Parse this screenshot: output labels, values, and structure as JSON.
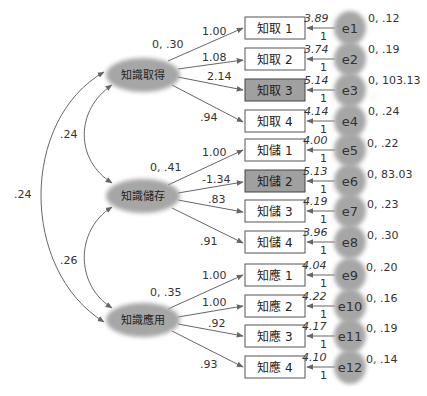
{
  "diagram": {
    "type": "SEM path diagram (confirmatory factor analysis)",
    "factors": [
      {
        "id": "f1",
        "label": "知識取得",
        "mean_var": "0, .30"
      },
      {
        "id": "f2",
        "label": "知識儲存",
        "mean_var": "0, .41"
      },
      {
        "id": "f3",
        "label": "知識應用",
        "mean_var": "0, .35"
      }
    ],
    "covariances": [
      {
        "from": "知識取得",
        "to": "知識儲存",
        "value": ".24"
      },
      {
        "from": "知識儲存",
        "to": "知識應用",
        "value": ".26"
      },
      {
        "from": "知識取得",
        "to": "知識應用",
        "value": ".24"
      }
    ],
    "indicators": [
      {
        "label": "知取 1",
        "factor": "知識取得",
        "loading": "1.00",
        "intercept": "3.89",
        "error": "e1",
        "error_mean_var": "0, .12",
        "error_path": "1",
        "highlighted": false
      },
      {
        "label": "知取 2",
        "factor": "知識取得",
        "loading": "1.08",
        "intercept": "3.74",
        "error": "e2",
        "error_mean_var": "0, .19",
        "error_path": "1",
        "highlighted": false
      },
      {
        "label": "知取 3",
        "factor": "知識取得",
        "loading": "2.14",
        "intercept": "5.14",
        "error": "e3",
        "error_mean_var": "0, 103.13",
        "error_path": "1",
        "highlighted": true
      },
      {
        "label": "知取 4",
        "factor": "知識取得",
        "loading": ".94",
        "intercept": "4.14",
        "error": "e4",
        "error_mean_var": "0, .24",
        "error_path": "1",
        "highlighted": false
      },
      {
        "label": "知儲 1",
        "factor": "知識儲存",
        "loading": "1.00",
        "intercept": "4.00",
        "error": "e5",
        "error_mean_var": "0, .22",
        "error_path": "1",
        "highlighted": false
      },
      {
        "label": "知儲 2",
        "factor": "知識儲存",
        "loading": "-1.34",
        "intercept": "5.13",
        "error": "e6",
        "error_mean_var": "0, 83.03",
        "error_path": "1",
        "highlighted": true
      },
      {
        "label": "知儲 3",
        "factor": "知識儲存",
        "loading": ".83",
        "intercept": "4.19",
        "error": "e7",
        "error_mean_var": "0, .23",
        "error_path": "1",
        "highlighted": false
      },
      {
        "label": "知儲 4",
        "factor": "知識儲存",
        "loading": ".91",
        "intercept": "3.96",
        "error": "e8",
        "error_mean_var": "0, .30",
        "error_path": "1",
        "highlighted": false
      },
      {
        "label": "知應 1",
        "factor": "知識應用",
        "loading": "1.00",
        "intercept": "4.04",
        "error": "e9",
        "error_mean_var": "0, .20",
        "error_path": "1",
        "highlighted": false
      },
      {
        "label": "知應 2",
        "factor": "知識應用",
        "loading": "1.00",
        "intercept": "4.22",
        "error": "e10",
        "error_mean_var": "0, .16",
        "error_path": "1",
        "highlighted": false
      },
      {
        "label": "知應 3",
        "factor": "知識應用",
        "loading": ".92",
        "intercept": "4.17",
        "error": "e11",
        "error_mean_var": "0, .19",
        "error_path": "1",
        "highlighted": false
      },
      {
        "label": "知應 4",
        "factor": "知識應用",
        "loading": ".93",
        "intercept": "4.10",
        "error": "e12",
        "error_mean_var": "0, .14",
        "error_path": "1",
        "highlighted": false
      }
    ]
  },
  "colors": {
    "factor_fill": "#a6a6a6",
    "error_fill": "#a6a6a6",
    "box_fill": "#ffffff",
    "box_highlight_fill": "#a0a0a0",
    "line": "#666666",
    "text": "#333333"
  }
}
